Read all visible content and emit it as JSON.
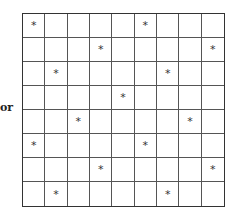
{
  "label": "or",
  "grid": {
    "rows": 8,
    "cols": 9,
    "mark_symbol": "*",
    "marks": [
      [
        0,
        0
      ],
      [
        0,
        5
      ],
      [
        1,
        3
      ],
      [
        1,
        8
      ],
      [
        2,
        1
      ],
      [
        2,
        6
      ],
      [
        3,
        4
      ],
      [
        4,
        2
      ],
      [
        4,
        7
      ],
      [
        5,
        0
      ],
      [
        5,
        5
      ],
      [
        6,
        3
      ],
      [
        6,
        8
      ],
      [
        7,
        1
      ],
      [
        7,
        6
      ]
    ]
  }
}
